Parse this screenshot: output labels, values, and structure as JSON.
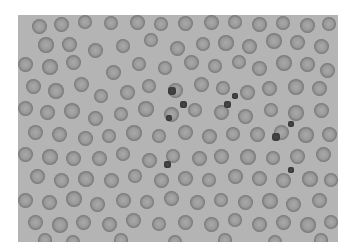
{
  "image": {
    "subject": "blood smear micrograph",
    "background_color": "#b4b4b4",
    "cell_color": "#7a7a7a"
  },
  "cells": [
    [
      14,
      4,
      15
    ],
    [
      36,
      2,
      15
    ],
    [
      60,
      0,
      14
    ],
    [
      86,
      1,
      14
    ],
    [
      112,
      0,
      15
    ],
    [
      136,
      2,
      14
    ],
    [
      160,
      1,
      15
    ],
    [
      186,
      0,
      15
    ],
    [
      210,
      0,
      14
    ],
    [
      234,
      2,
      15
    ],
    [
      258,
      1,
      14
    ],
    [
      282,
      3,
      15
    ],
    [
      304,
      2,
      14
    ],
    [
      20,
      22,
      16
    ],
    [
      44,
      22,
      15
    ],
    [
      70,
      28,
      15
    ],
    [
      98,
      24,
      14
    ],
    [
      126,
      18,
      14
    ],
    [
      152,
      26,
      15
    ],
    [
      178,
      22,
      14
    ],
    [
      200,
      20,
      16
    ],
    [
      224,
      24,
      15
    ],
    [
      248,
      18,
      16
    ],
    [
      272,
      20,
      15
    ],
    [
      296,
      24,
      15
    ],
    [
      0,
      42,
      15
    ],
    [
      24,
      44,
      16
    ],
    [
      48,
      40,
      15
    ],
    [
      88,
      50,
      15
    ],
    [
      114,
      42,
      14
    ],
    [
      140,
      46,
      14
    ],
    [
      166,
      40,
      15
    ],
    [
      190,
      44,
      14
    ],
    [
      214,
      40,
      14
    ],
    [
      234,
      46,
      15
    ],
    [
      258,
      40,
      16
    ],
    [
      282,
      42,
      15
    ],
    [
      302,
      48,
      15
    ],
    [
      8,
      64,
      15
    ],
    [
      30,
      68,
      16
    ],
    [
      56,
      62,
      15
    ],
    [
      76,
      74,
      14
    ],
    [
      102,
      70,
      15
    ],
    [
      124,
      64,
      14
    ],
    [
      150,
      68,
      15
    ],
    [
      176,
      62,
      15
    ],
    [
      198,
      66,
      14
    ],
    [
      222,
      70,
      15
    ],
    [
      244,
      66,
      15
    ],
    [
      270,
      64,
      16
    ],
    [
      294,
      66,
      15
    ],
    [
      0,
      86,
      15
    ],
    [
      22,
      90,
      15
    ],
    [
      46,
      88,
      16
    ],
    [
      70,
      96,
      15
    ],
    [
      96,
      92,
      14
    ],
    [
      120,
      86,
      16
    ],
    [
      146,
      92,
      15
    ],
    [
      170,
      88,
      14
    ],
    [
      196,
      90,
      15
    ],
    [
      220,
      94,
      15
    ],
    [
      246,
      88,
      14
    ],
    [
      270,
      90,
      16
    ],
    [
      296,
      88,
      15
    ],
    [
      10,
      110,
      15
    ],
    [
      34,
      112,
      15
    ],
    [
      60,
      116,
      15
    ],
    [
      84,
      114,
      14
    ],
    [
      108,
      110,
      16
    ],
    [
      134,
      114,
      14
    ],
    [
      160,
      110,
      15
    ],
    [
      184,
      114,
      15
    ],
    [
      208,
      112,
      14
    ],
    [
      232,
      112,
      15
    ],
    [
      256,
      110,
      15
    ],
    [
      280,
      112,
      16
    ],
    [
      304,
      112,
      15
    ],
    [
      0,
      132,
      15
    ],
    [
      24,
      134,
      16
    ],
    [
      48,
      136,
      15
    ],
    [
      74,
      136,
      15
    ],
    [
      98,
      132,
      14
    ],
    [
      124,
      138,
      15
    ],
    [
      148,
      134,
      14
    ],
    [
      174,
      136,
      15
    ],
    [
      196,
      134,
      15
    ],
    [
      222,
      134,
      16
    ],
    [
      248,
      136,
      14
    ],
    [
      272,
      134,
      15
    ],
    [
      298,
      132,
      15
    ],
    [
      12,
      154,
      15
    ],
    [
      36,
      158,
      15
    ],
    [
      60,
      156,
      16
    ],
    [
      86,
      158,
      15
    ],
    [
      110,
      154,
      14
    ],
    [
      136,
      158,
      15
    ],
    [
      160,
      156,
      15
    ],
    [
      184,
      158,
      14
    ],
    [
      210,
      154,
      15
    ],
    [
      234,
      156,
      15
    ],
    [
      258,
      158,
      15
    ],
    [
      284,
      156,
      16
    ],
    [
      306,
      158,
      14
    ],
    [
      0,
      178,
      15
    ],
    [
      24,
      180,
      15
    ],
    [
      48,
      176,
      16
    ],
    [
      72,
      182,
      15
    ],
    [
      98,
      178,
      15
    ],
    [
      122,
      180,
      14
    ],
    [
      146,
      176,
      15
    ],
    [
      172,
      180,
      15
    ],
    [
      196,
      178,
      14
    ],
    [
      220,
      180,
      15
    ],
    [
      244,
      178,
      16
    ],
    [
      268,
      182,
      15
    ],
    [
      294,
      178,
      15
    ],
    [
      10,
      200,
      15
    ],
    [
      34,
      202,
      16
    ],
    [
      58,
      200,
      15
    ],
    [
      84,
      202,
      15
    ],
    [
      108,
      198,
      15
    ],
    [
      134,
      202,
      14
    ],
    [
      160,
      200,
      15
    ],
    [
      186,
      202,
      15
    ],
    [
      210,
      198,
      14
    ],
    [
      234,
      202,
      15
    ],
    [
      258,
      200,
      15
    ],
    [
      282,
      202,
      16
    ],
    [
      306,
      200,
      14
    ],
    [
      20,
      218,
      14
    ],
    [
      48,
      220,
      14
    ],
    [
      96,
      218,
      14
    ],
    [
      150,
      220,
      14
    ],
    [
      200,
      218,
      14
    ],
    [
      250,
      220,
      14
    ],
    [
      296,
      218,
      14
    ]
  ],
  "dark_cells": [
    [
      150,
      72,
      8
    ],
    [
      162,
      86,
      7
    ],
    [
      206,
      86,
      7
    ],
    [
      148,
      100,
      6
    ],
    [
      214,
      78,
      6
    ],
    [
      254,
      118,
      8
    ],
    [
      270,
      106,
      6
    ],
    [
      146,
      146,
      7
    ],
    [
      270,
      152,
      6
    ]
  ]
}
